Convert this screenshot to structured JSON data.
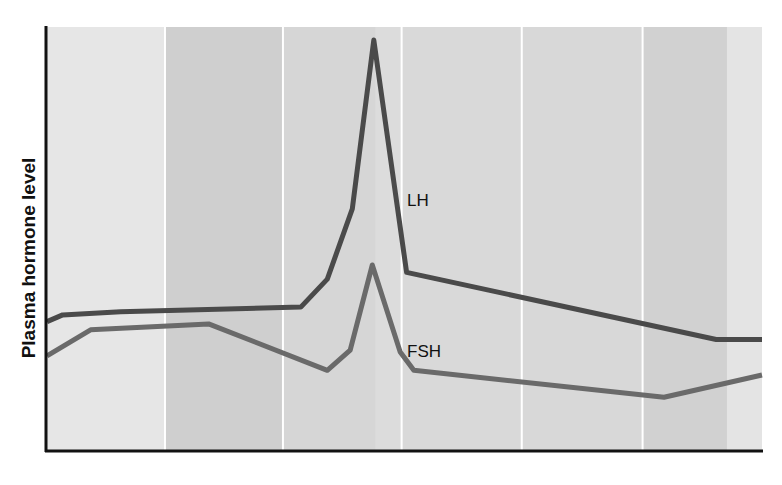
{
  "chart_data": {
    "type": "line",
    "title": "",
    "xlabel": "",
    "ylabel": "Plasma hormone level",
    "x_ticks": [],
    "y_ticks": [],
    "grid": false,
    "legend": "inline labels next to curves",
    "x_range": [
      0,
      100
    ],
    "y_range": [
      0,
      100
    ],
    "background_bands": [
      {
        "x_start": 0,
        "x_end": 16.5,
        "color": "#e6e6e6"
      },
      {
        "x_start": 16.5,
        "x_end": 33.0,
        "color": "#cfcfcf"
      },
      {
        "x_start": 33.0,
        "x_end": 46.0,
        "color": "#d6d6d6"
      },
      {
        "x_start": 46.0,
        "x_end": 49.6,
        "color": "#dcdcdc"
      },
      {
        "x_start": 49.6,
        "x_end": 66.4,
        "color": "#d9d9d9"
      },
      {
        "x_start": 66.4,
        "x_end": 83.3,
        "color": "#d8d8d8"
      },
      {
        "x_start": 83.3,
        "x_end": 95.1,
        "color": "#d1d1d1"
      },
      {
        "x_start": 95.1,
        "x_end": 100,
        "color": "#e4e4e4"
      }
    ],
    "band_separators_x": [
      16.5,
      33.0,
      49.6,
      66.4,
      83.3
    ],
    "series": [
      {
        "name": "LH",
        "color": "#4a4a4a",
        "points": [
          [
            0,
            27.8
          ],
          [
            2.2,
            29.5
          ],
          [
            10.3,
            30.3
          ],
          [
            35.5,
            31.5
          ],
          [
            39.2,
            38.7
          ],
          [
            42.7,
            56.7
          ],
          [
            45.7,
            100
          ],
          [
            50.3,
            40.4
          ],
          [
            93.6,
            23.2
          ],
          [
            100,
            23.2
          ]
        ]
      },
      {
        "name": "FSH",
        "color": "#6a6a6a",
        "points": [
          [
            0,
            19.0
          ],
          [
            6.1,
            25.7
          ],
          [
            22.6,
            27.2
          ],
          [
            39.2,
            15.3
          ],
          [
            42.4,
            20.5
          ],
          [
            45.5,
            42.3
          ],
          [
            49.4,
            20.0
          ],
          [
            51.3,
            15.3
          ],
          [
            86.3,
            8.4
          ],
          [
            100,
            14.1
          ]
        ]
      }
    ]
  },
  "labels": {
    "ylabel": "Plasma hormone level",
    "lh": "LH",
    "fsh": "FSH"
  },
  "colors": {
    "axis": "#111111",
    "separator": "#ffffff",
    "lh_line": "#4a4a4a",
    "fsh_line": "#6a6a6a"
  }
}
